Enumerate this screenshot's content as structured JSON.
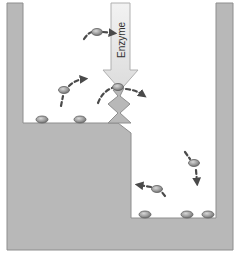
{
  "diagram": {
    "type": "energy-level / reaction-barrier illustration",
    "enzyme_label": "Enzyme",
    "colors": {
      "container": "#b8b8b8",
      "container_edge": "#8e8e8e",
      "background": "#ffffff",
      "arrow_fill": "#e6e6e6",
      "arrow_edge": "#b0b0b0",
      "molecule": "#9a9a9a",
      "molecule_edge": "#5e5e5e",
      "motion_arrow": "#4a4a4a"
    },
    "regions": [
      {
        "name": "upper-left-chamber",
        "floor_y": 123,
        "x_range": [
          23,
          131
        ]
      },
      {
        "name": "lower-right-chamber",
        "floor_y": 218,
        "x_range": [
          131,
          216
        ]
      }
    ],
    "barrier": {
      "shape": "zigzag",
      "x": 118,
      "top_y": 88,
      "bottom_y": 123
    },
    "molecules": [
      {
        "id": "m1",
        "x": 97,
        "y": 32,
        "state": "moving",
        "direction": "right"
      },
      {
        "id": "m2",
        "x": 64,
        "y": 90,
        "state": "moving",
        "direction": "up-right"
      },
      {
        "id": "m3",
        "x": 118,
        "y": 87,
        "state": "crossing-barrier",
        "direction": "right"
      },
      {
        "id": "m4",
        "x": 42,
        "y": 119,
        "state": "resting"
      },
      {
        "id": "m5",
        "x": 80,
        "y": 119,
        "state": "resting"
      },
      {
        "id": "m6",
        "x": 194,
        "y": 163,
        "state": "moving",
        "direction": "down"
      },
      {
        "id": "m7",
        "x": 157,
        "y": 189,
        "state": "moving",
        "direction": "left"
      },
      {
        "id": "m8",
        "x": 145,
        "y": 215,
        "state": "resting"
      },
      {
        "id": "m9",
        "x": 187,
        "y": 215,
        "state": "resting"
      },
      {
        "id": "m10",
        "x": 208,
        "y": 215,
        "state": "resting"
      }
    ]
  }
}
